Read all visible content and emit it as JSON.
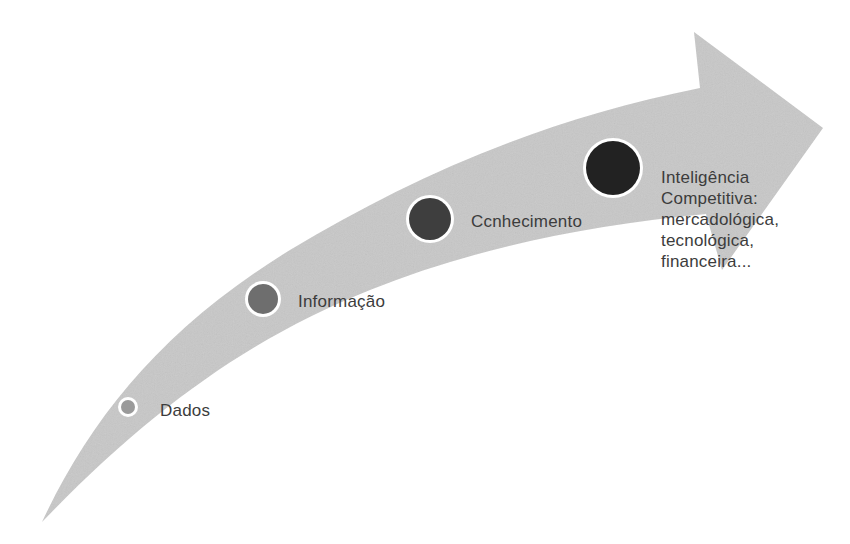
{
  "diagram": {
    "type": "progression-arrow",
    "arrow_color": "#c8c8c8",
    "ring_color": "#ffffff",
    "stages": [
      {
        "label": "Dados",
        "dot_color": "#9a9a9a",
        "cx": 128,
        "cy": 407,
        "r": 7
      },
      {
        "label": "Informação",
        "dot_color": "#6e6e6e",
        "cx": 263,
        "cy": 299,
        "r": 15
      },
      {
        "label": "Ccnhecimento",
        "dot_color": "#3e3e3e",
        "cx": 430,
        "cy": 219,
        "r": 21
      },
      {
        "label": "Inteligência Competitiva: mercadológica, tecnológica, financeira...",
        "dot_color": "#222222",
        "cx": 613,
        "cy": 168,
        "r": 27
      }
    ],
    "final_stage_lines": [
      "Inteligência",
      "Competitiva:",
      "mercadológica,",
      "tecnológica,",
      "financeira..."
    ]
  }
}
